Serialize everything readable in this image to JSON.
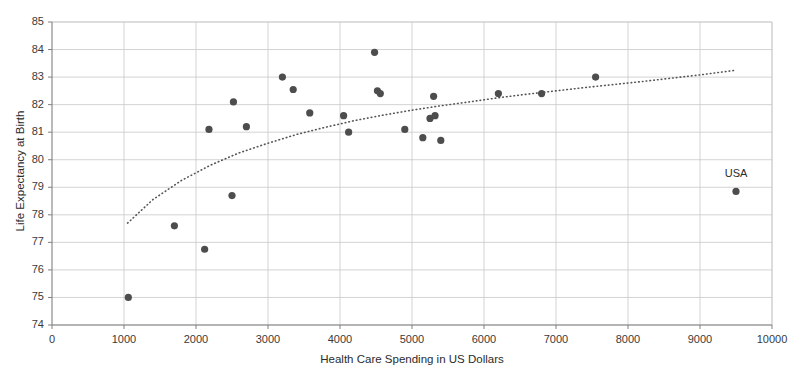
{
  "chart_data": {
    "type": "scatter",
    "title": "",
    "xlabel": "Health Care Spending in US Dollars",
    "ylabel": "Life Expectancy at Birth",
    "xlim": [
      0,
      10000
    ],
    "ylim": [
      74,
      85
    ],
    "xticks": [
      0,
      1000,
      2000,
      3000,
      4000,
      5000,
      6000,
      7000,
      8000,
      9000,
      10000
    ],
    "yticks": [
      74,
      75,
      76,
      77,
      78,
      79,
      80,
      81,
      82,
      83,
      84,
      85
    ],
    "grid": "horizontal-and-vertical",
    "legend": "none",
    "marker_color": "#4d4d4d",
    "marker_size": 6,
    "grid_color": "#c8c8c8",
    "axis_color": "#808080",
    "points": [
      {
        "x": 1060,
        "y": 75.0,
        "label": ""
      },
      {
        "x": 1700,
        "y": 77.6,
        "label": ""
      },
      {
        "x": 2120,
        "y": 76.75,
        "label": ""
      },
      {
        "x": 2180,
        "y": 81.1,
        "label": ""
      },
      {
        "x": 2500,
        "y": 78.7,
        "label": ""
      },
      {
        "x": 2520,
        "y": 82.1,
        "label": ""
      },
      {
        "x": 2700,
        "y": 81.2,
        "label": ""
      },
      {
        "x": 3200,
        "y": 83.0,
        "label": ""
      },
      {
        "x": 3350,
        "y": 82.55,
        "label": ""
      },
      {
        "x": 3580,
        "y": 81.7,
        "label": ""
      },
      {
        "x": 4050,
        "y": 81.6,
        "label": ""
      },
      {
        "x": 4120,
        "y": 81.0,
        "label": ""
      },
      {
        "x": 4480,
        "y": 83.9,
        "label": ""
      },
      {
        "x": 4520,
        "y": 82.5,
        "label": ""
      },
      {
        "x": 4560,
        "y": 82.4,
        "label": ""
      },
      {
        "x": 4900,
        "y": 81.1,
        "label": ""
      },
      {
        "x": 5150,
        "y": 80.8,
        "label": ""
      },
      {
        "x": 5250,
        "y": 81.5,
        "label": ""
      },
      {
        "x": 5300,
        "y": 82.3,
        "label": ""
      },
      {
        "x": 5320,
        "y": 81.6,
        "label": ""
      },
      {
        "x": 5400,
        "y": 80.7,
        "label": ""
      },
      {
        "x": 6200,
        "y": 82.4,
        "label": ""
      },
      {
        "x": 6800,
        "y": 82.4,
        "label": ""
      },
      {
        "x": 7550,
        "y": 83.0,
        "label": ""
      },
      {
        "x": 9500,
        "y": 78.85,
        "label": "USA"
      }
    ],
    "trendline": {
      "style": "dotted",
      "color": "#555555",
      "x_start": 1050,
      "x_end": 9500,
      "y_start": 77.7,
      "y_end": 83.25,
      "shape": "logarithmic",
      "points": [
        {
          "x": 1050,
          "y": 77.7
        },
        {
          "x": 1400,
          "y": 78.55
        },
        {
          "x": 1800,
          "y": 79.25
        },
        {
          "x": 2200,
          "y": 79.8
        },
        {
          "x": 2600,
          "y": 80.25
        },
        {
          "x": 3000,
          "y": 80.6
        },
        {
          "x": 3400,
          "y": 80.92
        },
        {
          "x": 3800,
          "y": 81.18
        },
        {
          "x": 4200,
          "y": 81.42
        },
        {
          "x": 4600,
          "y": 81.62
        },
        {
          "x": 5000,
          "y": 81.8
        },
        {
          "x": 5400,
          "y": 81.96
        },
        {
          "x": 5800,
          "y": 82.1
        },
        {
          "x": 6200,
          "y": 82.25
        },
        {
          "x": 6600,
          "y": 82.38
        },
        {
          "x": 7000,
          "y": 82.5
        },
        {
          "x": 7400,
          "y": 82.62
        },
        {
          "x": 7800,
          "y": 82.73
        },
        {
          "x": 8200,
          "y": 82.84
        },
        {
          "x": 8600,
          "y": 82.96
        },
        {
          "x": 9000,
          "y": 83.08
        },
        {
          "x": 9500,
          "y": 83.25
        }
      ]
    }
  }
}
